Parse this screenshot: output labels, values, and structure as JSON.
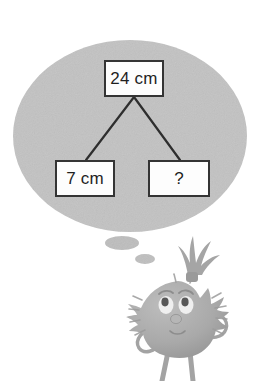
{
  "scene": {
    "title": "Thinking monster with part-whole diagram",
    "background_color": "#ffffff",
    "width": 276,
    "height": 381
  },
  "thought_bubble": {
    "shape": "ellipse",
    "fill_color": "#c2c2c2",
    "center_x": 130,
    "center_y": 136,
    "radius_x": 117,
    "radius_y": 96,
    "trail": [
      {
        "name": "bubble-trail-large",
        "cx": 122,
        "cy": 243,
        "rx": 17,
        "ry": 7
      },
      {
        "name": "bubble-trail-small",
        "cx": 145,
        "cy": 259,
        "rx": 10,
        "ry": 5
      }
    ]
  },
  "diagram": {
    "type": "part-whole-bar-model",
    "whole": {
      "label": "24 cm",
      "value": 24,
      "unit": "cm"
    },
    "parts": [
      {
        "label": "7 cm",
        "value": 7,
        "unit": "cm"
      },
      {
        "label": "?",
        "value": null,
        "unit": "cm"
      }
    ],
    "connector_color": "#2e2e2e",
    "box_border_color": "#343434",
    "box_fill_color": "#fdfdfd"
  },
  "character": {
    "name": "furry-monster",
    "body_color": "#a8a8a8",
    "shade_color": "#949494",
    "light_color": "#c0c0c0",
    "eye_white_color": "#efefef",
    "outline_color": "#8a8a8a",
    "expression": "thinking",
    "parts": [
      "hair-tuft",
      "furry-body",
      "eyes",
      "nose",
      "mouth",
      "arms",
      "legs"
    ]
  }
}
